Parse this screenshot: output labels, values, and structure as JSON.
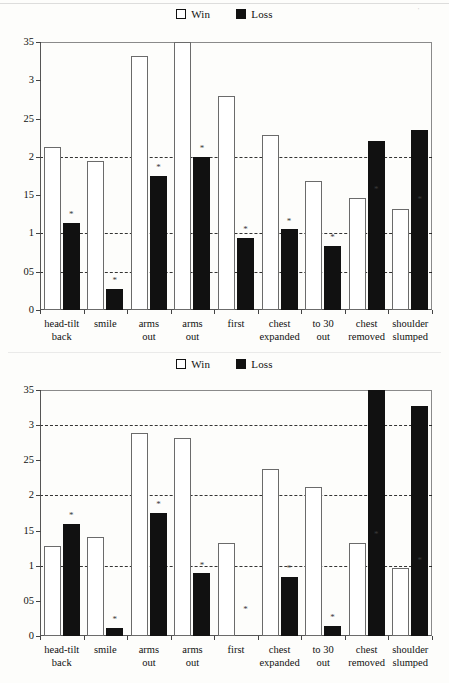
{
  "figure": {
    "legend": {
      "items": [
        {
          "label": "Win",
          "swatch": "white-square-icon",
          "color": "#ffffff"
        },
        {
          "label": "Loss",
          "swatch": "black-square-icon",
          "color": "#111111"
        }
      ],
      "position": "top-center"
    },
    "categories": [
      [
        "head-tilt",
        "back"
      ],
      [
        "smile",
        ""
      ],
      [
        "arms",
        "out"
      ],
      [
        "arms",
        "out"
      ],
      [
        "first",
        ""
      ],
      [
        "chest",
        "expanded"
      ],
      [
        "to 30",
        "out"
      ],
      [
        "chest",
        "removed"
      ],
      [
        "shoulder",
        "slumped"
      ]
    ],
    "y_ticks": [
      "35",
      "3",
      "25",
      "2",
      "15",
      "1",
      "05",
      "0"
    ],
    "gridline_values": [
      2,
      1,
      0.5
    ]
  },
  "chart_data": [
    {
      "type": "bar",
      "title": "",
      "panel": "top",
      "xlabel": "",
      "ylabel": "",
      "ylim": [
        0,
        3.5
      ],
      "yticks": [
        3.5,
        3,
        2.5,
        2,
        1.5,
        1,
        0.5,
        0
      ],
      "ytick_labels": [
        "35",
        "3",
        "25",
        "2",
        "15",
        "1",
        "05",
        "0"
      ],
      "grid": true,
      "gridlines_at": [
        2,
        1,
        0.5
      ],
      "legend": [
        "Win",
        "Loss"
      ],
      "categories": [
        "head-tilt back",
        "smile",
        "arms out",
        "arms out",
        "first",
        "chest expanded",
        "to 30 out",
        "chest removed",
        "shoulder slumped"
      ],
      "series": [
        {
          "name": "Win",
          "values": [
            2.13,
            1.94,
            3.32,
            3.5,
            2.79,
            2.29,
            1.68,
            1.46,
            1.32
          ]
        },
        {
          "name": "Loss",
          "values": [
            1.14,
            0.27,
            1.75,
            2.0,
            0.94,
            1.06,
            0.84,
            2.21,
            2.35
          ]
        }
      ],
      "significance_markers": {
        "series": "Loss",
        "at": [
          {
            "category": "head-tilt back",
            "value": 1.2,
            "symbol": "*"
          },
          {
            "category": "smile",
            "value": 0.34,
            "symbol": "*"
          },
          {
            "category": "arms out",
            "value": 1.81,
            "symbol": "*"
          },
          {
            "category": "arms out ",
            "value": 2.06,
            "symbol": "*"
          },
          {
            "category": "first",
            "value": 1.0,
            "symbol": "*"
          },
          {
            "category": "chest expanded",
            "value": 1.11,
            "symbol": "*"
          },
          {
            "category": "to 30 out",
            "value": 0.9,
            "symbol": "*"
          },
          {
            "category": "chest removed",
            "value": 1.53,
            "symbol": "*"
          },
          {
            "category": "shoulder slumped",
            "value": 1.4,
            "symbol": "*"
          }
        ]
      }
    },
    {
      "type": "bar",
      "title": "",
      "panel": "bottom",
      "xlabel": "",
      "ylabel": "",
      "ylim": [
        0,
        3.5
      ],
      "yticks": [
        3.5,
        3,
        2.5,
        2,
        1.5,
        1,
        0.5,
        0
      ],
      "ytick_labels": [
        "35",
        "3",
        "25",
        "2",
        "15",
        "1",
        "05",
        "0"
      ],
      "grid": true,
      "gridlines_at": [
        3,
        2,
        1
      ],
      "legend": [
        "Win",
        "Loss"
      ],
      "categories": [
        "head-tilt back",
        "smile",
        "arms out",
        "arms out",
        "first",
        "chest expanded",
        "to 30 out",
        "chest removed",
        "shoulder slumped"
      ],
      "series": [
        {
          "name": "Win",
          "values": [
            1.28,
            1.41,
            2.89,
            2.82,
            1.33,
            2.38,
            2.12,
            1.33,
            0.97
          ]
        },
        {
          "name": "Loss",
          "values": [
            1.59,
            0.11,
            1.75,
            0.89,
            0.0,
            0.84,
            0.14,
            3.5,
            3.27
          ]
        }
      ],
      "significance_markers": {
        "series": "Loss",
        "at": [
          {
            "category": "head-tilt back",
            "value": 1.66,
            "symbol": "*"
          },
          {
            "category": "smile",
            "value": 0.18,
            "symbol": "*"
          },
          {
            "category": "arms out",
            "value": 1.82,
            "symbol": "*"
          },
          {
            "category": "arms out ",
            "value": 0.96,
            "symbol": "*"
          },
          {
            "category": "first",
            "value": 0.33,
            "symbol": "*"
          },
          {
            "category": "chest expanded",
            "value": 0.91,
            "symbol": "*"
          },
          {
            "category": "to 30 out",
            "value": 0.21,
            "symbol": "*"
          },
          {
            "category": "chest removed",
            "value": 1.4,
            "symbol": "*"
          },
          {
            "category": "shoulder slumped",
            "value": 1.03,
            "symbol": "*"
          }
        ]
      }
    }
  ]
}
